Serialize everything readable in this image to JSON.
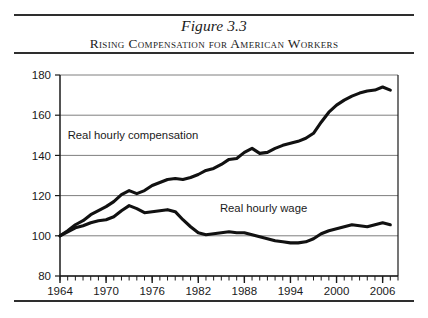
{
  "figure": {
    "title": "Figure 3.3",
    "subtitle": "Rising Compensation for American Workers"
  },
  "chart_data": {
    "type": "line",
    "title": "Rising Compensation for American Workers",
    "xlabel": "",
    "ylabel": "",
    "xlim": [
      1964,
      2008
    ],
    "ylim": [
      80,
      180
    ],
    "ytick_values": [
      80,
      100,
      120,
      140,
      160,
      180
    ],
    "ytick_labels": [
      "80",
      "100",
      "120",
      "140",
      "160",
      "180"
    ],
    "xtick_values": [
      1964,
      1970,
      1976,
      1982,
      1988,
      1994,
      2000,
      2006
    ],
    "xtick_labels": [
      "1964",
      "1970",
      "1976",
      "1982",
      "1988",
      "1994",
      "2000",
      "2006"
    ],
    "minor_xticks_every": 1,
    "grid": "horizontal",
    "legend": "inline-annotations",
    "index_base": "1964 = 100",
    "x": [
      1964,
      1965,
      1966,
      1967,
      1968,
      1969,
      1970,
      1971,
      1972,
      1973,
      1974,
      1975,
      1976,
      1977,
      1978,
      1979,
      1980,
      1981,
      1982,
      1983,
      1984,
      1985,
      1986,
      1987,
      1988,
      1989,
      1990,
      1991,
      1992,
      1993,
      1994,
      1995,
      1996,
      1997,
      1998,
      1999,
      2000,
      2001,
      2002,
      2003,
      2004,
      2005,
      2006,
      2007
    ],
    "series": [
      {
        "name": "Real hourly compensation",
        "annotation": "Real hourly compensation",
        "annotation_x": 1973.5,
        "annotation_y": 148,
        "color": "#111111",
        "values": [
          100.0,
          102.5,
          105.5,
          107.5,
          110.5,
          112.5,
          114.5,
          117.0,
          120.5,
          122.5,
          121.0,
          122.5,
          125.0,
          126.5,
          128.0,
          128.5,
          128.0,
          129.0,
          130.5,
          132.5,
          133.5,
          135.5,
          138.0,
          138.5,
          141.5,
          143.5,
          141.0,
          141.5,
          143.5,
          145.0,
          146.0,
          147.0,
          148.5,
          151.0,
          156.5,
          161.5,
          165.0,
          167.5,
          169.5,
          171.0,
          172.0,
          172.5,
          174.0,
          172.5
        ]
      },
      {
        "name": "Real hourly wage",
        "annotation": "Real hourly wage",
        "annotation_x": 1990.5,
        "annotation_y": 112,
        "color": "#111111",
        "values": [
          100.0,
          102.0,
          104.0,
          105.0,
          106.5,
          107.5,
          108.0,
          109.5,
          112.5,
          115.0,
          113.5,
          111.5,
          112.0,
          112.5,
          113.0,
          112.0,
          108.0,
          104.5,
          101.5,
          100.5,
          101.0,
          101.5,
          102.0,
          101.5,
          101.5,
          100.5,
          99.5,
          98.5,
          97.5,
          97.0,
          96.5,
          96.5,
          97.0,
          98.5,
          101.0,
          102.5,
          103.5,
          104.5,
          105.5,
          105.0,
          104.5,
          105.5,
          106.5,
          105.5
        ]
      }
    ]
  }
}
